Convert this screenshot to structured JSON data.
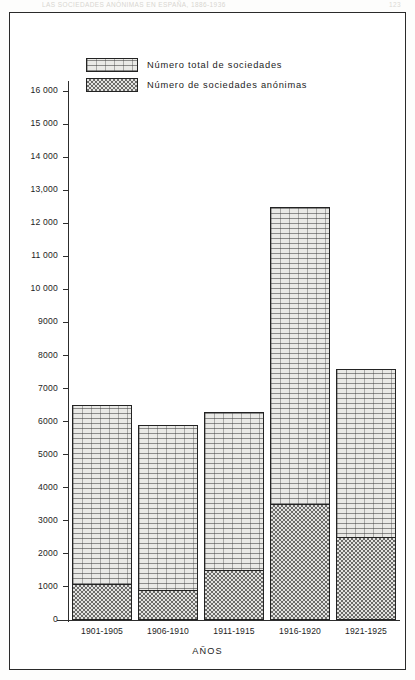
{
  "page_header": {
    "running_title": "LAS SOCIEDADES ANÓNIMAS EN ESPAÑA, 1886-1936",
    "folio": "123"
  },
  "legend": {
    "position": "top-left-inside",
    "items": [
      {
        "label": "Número total de sociedades",
        "pattern": "light-brick-hatch",
        "swatch_color": "#e9e9e6"
      },
      {
        "label": "Número de sociedades anónimas",
        "pattern": "dark-checker-dot",
        "swatch_color": "#b8b8b4"
      }
    ]
  },
  "axes": {
    "x_title": "AÑOS",
    "y_title": "",
    "y_ticks": [
      "0",
      "1000",
      "2000",
      "3000",
      "4000",
      "5000",
      "6000",
      "7000",
      "8000",
      "9000",
      "10 000",
      "11 000",
      "12 000",
      "13,000",
      "14 000",
      "15 000",
      "16 000"
    ]
  },
  "chart_data": {
    "type": "bar",
    "title": "",
    "subtitle": "",
    "xlabel": "AÑOS",
    "ylabel": "",
    "ylim": [
      0,
      16500
    ],
    "ytick_values": [
      0,
      1000,
      2000,
      3000,
      4000,
      5000,
      6000,
      7000,
      8000,
      9000,
      10000,
      11000,
      12000,
      13000,
      14000,
      15000,
      16000
    ],
    "grid": false,
    "stacked": true,
    "legend_position": "upper left (inside plot)",
    "categories": [
      "1901-1905",
      "1906-1910",
      "1911-1915",
      "1916-1920",
      "1921-1925"
    ],
    "series": [
      {
        "name": "Número total de sociedades",
        "values": [
          6500,
          5900,
          6300,
          12500,
          7600
        ]
      },
      {
        "name": "Número de sociedades anónimas",
        "values": [
          1100,
          900,
          1500,
          3500,
          2500
        ]
      }
    ]
  }
}
